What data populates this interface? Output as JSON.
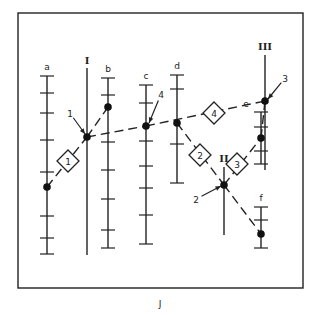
{
  "figure": {
    "caption": "J",
    "frame": {
      "left": 18,
      "top": 13,
      "right": 303,
      "bottom": 288
    }
  },
  "scales": [
    {
      "id": "a",
      "label": "a",
      "x": 47,
      "y1": 76,
      "y2": 254,
      "ticks": [
        76,
        93,
        113,
        140,
        172,
        216,
        238,
        254
      ],
      "node": 187
    },
    {
      "id": "b",
      "label": "b",
      "x": 108,
      "y1": 78,
      "y2": 248,
      "ticks": [
        78,
        95,
        142,
        170,
        199,
        230,
        248
      ],
      "node": 107
    },
    {
      "id": "c",
      "label": "c",
      "x": 146,
      "y1": 85,
      "y2": 244,
      "ticks": [
        85,
        103,
        141,
        166,
        188,
        215,
        244
      ],
      "node": 126
    },
    {
      "id": "d",
      "label": "d",
      "x": 177,
      "y1": 75,
      "y2": 183,
      "ticks": [
        75,
        89,
        144,
        183
      ],
      "node": 123
    },
    {
      "id": "e",
      "label": "e",
      "x": 261,
      "y1": 112,
      "y2": 164,
      "ticks": [
        112,
        127,
        151,
        164
      ],
      "node": 138
    },
    {
      "id": "f",
      "label": "f",
      "x": 261,
      "y1": 207,
      "y2": 248,
      "ticks": [
        207,
        220,
        248
      ],
      "node": 234
    }
  ],
  "axes": [
    {
      "id": "I",
      "label": "I",
      "x": 87,
      "y1": 68,
      "y2": 255,
      "node": 137
    },
    {
      "id": "II",
      "label": "II",
      "x": 224,
      "y1": 167,
      "y2": 235,
      "node": 185
    },
    {
      "id": "III",
      "label": "III",
      "x": 265,
      "y1": 55,
      "y2": 170,
      "node": 101
    }
  ],
  "index_lines": [
    {
      "step": "1",
      "from": "a",
      "via": "I",
      "to": "b"
    },
    {
      "step": "2",
      "from": "d",
      "via": "II",
      "to": "f"
    },
    {
      "step": "3",
      "from": "II",
      "via": "e",
      "to": "III"
    },
    {
      "step": "4",
      "from": "I",
      "via": "c",
      "to": "III"
    }
  ],
  "step_diamonds": [
    {
      "label": "1",
      "x": 68,
      "y": 161
    },
    {
      "label": "2",
      "x": 200,
      "y": 155
    },
    {
      "label": "3",
      "x": 237,
      "y": 164
    },
    {
      "label": "4",
      "x": 214,
      "y": 113
    }
  ],
  "pointer_labels": [
    {
      "label": "1",
      "tx": 70,
      "ty": 117,
      "ax": 85,
      "ay": 134
    },
    {
      "label": "4",
      "tx": 161,
      "ty": 98,
      "ax": 149,
      "ay": 123
    },
    {
      "label": "2",
      "tx": 196,
      "ty": 203,
      "ax": 221,
      "ay": 186
    },
    {
      "label": "3",
      "tx": 285,
      "ty": 82,
      "ax": 268,
      "ay": 99
    }
  ],
  "roman_labels": [
    {
      "text": "I",
      "x": 87,
      "y": 64
    },
    {
      "text": "II",
      "x": 224,
      "y": 162
    },
    {
      "text": "III",
      "x": 265,
      "y": 50
    }
  ]
}
